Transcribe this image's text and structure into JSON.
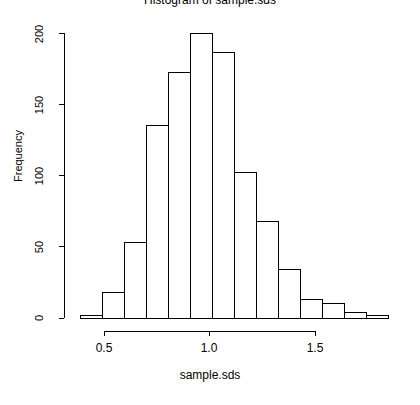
{
  "chart_data": {
    "type": "bar",
    "title": "Histogram of sample.sds",
    "xlabel": "sample.sds",
    "ylabel": "Frequency",
    "subtitle": "",
    "grid": false,
    "legend": "none",
    "bin_width": 0.1,
    "bin_edges": [
      0.4,
      0.5,
      0.6,
      0.7,
      0.8,
      0.9,
      1.0,
      1.1,
      1.2,
      1.3,
      1.4,
      1.5,
      1.6,
      1.7,
      1.8
    ],
    "categories": [
      "0.4-0.5",
      "0.5-0.6",
      "0.6-0.7",
      "0.7-0.8",
      "0.8-0.9",
      "0.9-1.0",
      "1.0-1.1",
      "1.1-1.2",
      "1.2-1.3",
      "1.3-1.4",
      "1.4-1.5",
      "1.5-1.6",
      "1.6-1.7",
      "1.7-1.8"
    ],
    "values": [
      2,
      18,
      53,
      135,
      172,
      200,
      186,
      102,
      68,
      34,
      13,
      10,
      4,
      2
    ],
    "xlim": [
      0.4,
      1.8
    ],
    "ylim": [
      0,
      200
    ],
    "xticks": [
      0.5,
      1.0,
      1.5
    ],
    "xtick_labels": [
      "0.5",
      "1.0",
      "1.5"
    ],
    "yticks": [
      0,
      50,
      100,
      150,
      200
    ],
    "ytick_labels": [
      "0",
      "50",
      "100",
      "150",
      "200"
    ],
    "bar_fill": "#ffffff",
    "bar_stroke": "#000000",
    "axis_color": "#000000",
    "background": "#ffffff"
  },
  "axes": {
    "y_labels": [
      "0",
      "50",
      "100",
      "150",
      "200"
    ],
    "x_labels": [
      "0.5",
      "1.0",
      "1.5"
    ]
  }
}
